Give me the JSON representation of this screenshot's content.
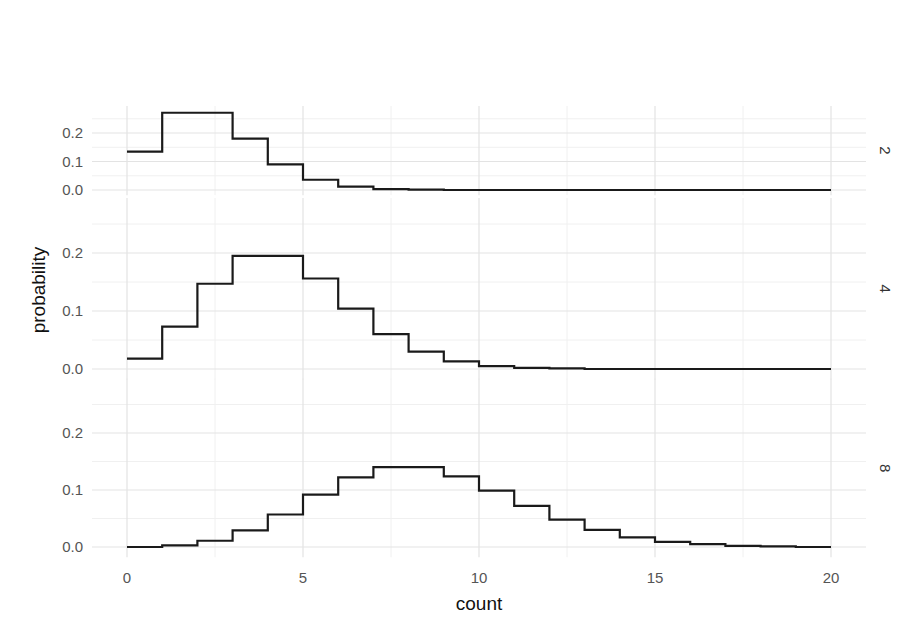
{
  "chart_data": {
    "type": "line",
    "subtype": "step",
    "title": "",
    "xlabel": "count",
    "ylabel": "probability",
    "xlim": [
      0,
      20
    ],
    "x_ticks": [
      0,
      5,
      10,
      15,
      20
    ],
    "y_ticks": [
      0.0,
      0.1,
      0.2
    ],
    "y_tick_labels": [
      "0.0",
      "0.1",
      "0.2"
    ],
    "grid": true,
    "facet": "rows",
    "x": [
      0,
      1,
      2,
      3,
      4,
      5,
      6,
      7,
      8,
      9,
      10,
      11,
      12,
      13,
      14,
      15,
      16,
      17,
      18,
      19,
      20
    ],
    "series": [
      {
        "name": "2",
        "values": [
          0.135,
          0.271,
          0.271,
          0.18,
          0.09,
          0.036,
          0.012,
          0.003,
          0.001,
          0.0,
          0.0,
          0.0,
          0.0,
          0.0,
          0.0,
          0.0,
          0.0,
          0.0,
          0.0,
          0.0,
          0.0
        ]
      },
      {
        "name": "4",
        "values": [
          0.018,
          0.073,
          0.147,
          0.195,
          0.195,
          0.156,
          0.104,
          0.06,
          0.03,
          0.013,
          0.005,
          0.002,
          0.001,
          0.0,
          0.0,
          0.0,
          0.0,
          0.0,
          0.0,
          0.0,
          0.0
        ]
      },
      {
        "name": "8",
        "values": [
          0.0,
          0.003,
          0.011,
          0.029,
          0.057,
          0.092,
          0.122,
          0.14,
          0.14,
          0.124,
          0.099,
          0.072,
          0.048,
          0.03,
          0.017,
          0.009,
          0.005,
          0.002,
          0.001,
          0.0,
          0.0
        ]
      }
    ]
  },
  "panels": [
    {
      "strip_label": "2",
      "zero_y": 190,
      "tick02_y": 133
    },
    {
      "strip_label": "4",
      "zero_y": 369,
      "tick02_y": 253
    },
    {
      "strip_label": "8",
      "zero_y": 547,
      "tick02_y": 433
    }
  ],
  "axis": {
    "x_label": "count",
    "y_label": "probability",
    "x_tick_labels": [
      "0",
      "5",
      "10",
      "15",
      "20"
    ]
  },
  "colors": {
    "line": "#1a1a1a",
    "grid_major": "#e3e3e3",
    "grid_minor": "#f0f0f0",
    "tick_text": "#555555"
  }
}
